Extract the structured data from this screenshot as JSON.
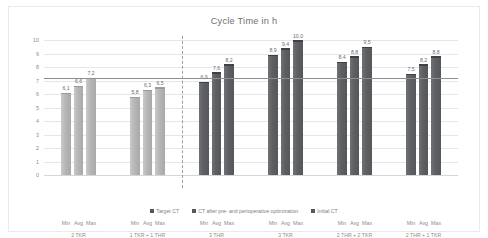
{
  "chart_data": {
    "type": "bar",
    "title": "Cycle Time in h",
    "xlabel": "",
    "ylabel": "",
    "ylim": [
      0,
      10
    ],
    "yticks": [
      "0",
      "1",
      "2",
      "3",
      "4",
      "5",
      "6",
      "7",
      "8",
      "9",
      "10"
    ],
    "grid": true,
    "legend_position": "bottom",
    "categories": [
      "Min",
      "Avg",
      "Max"
    ],
    "groups": [
      {
        "label": "2 TKR",
        "series": "ct_optimized",
        "values": [
          6.1,
          6.6,
          7.2
        ]
      },
      {
        "label": "1 TKR + 1 THR",
        "series": "ct_optimized",
        "values": [
          5.8,
          6.3,
          6.5
        ]
      },
      {
        "label": "3 THR",
        "series": "initial_ct",
        "values": [
          6.9,
          7.6,
          8.2
        ]
      },
      {
        "label": "3 TKR",
        "series": "initial_ct",
        "values": [
          8.9,
          9.4,
          10.0
        ]
      },
      {
        "label": "2 THR + 2 TKR",
        "series": "initial_ct",
        "values": [
          8.4,
          8.8,
          9.5
        ]
      },
      {
        "label": "2 THR + 1 TKR",
        "series": "initial_ct",
        "values": [
          7.5,
          8.2,
          8.8
        ]
      }
    ],
    "target_ct_line": 7.2,
    "annotations": {
      "separator_after_group_index": 1
    },
    "legend": [
      {
        "label": "Target CT",
        "color": "#55575b"
      },
      {
        "label": "CT after pre- and perioperative optimization",
        "color": "#55575b"
      },
      {
        "label": "Initial CT",
        "color": "#55575b"
      }
    ]
  },
  "colors": {
    "light_bar": "#b6b6b6",
    "dark_bar": "#5d5f63",
    "target_line": "#8b8e92",
    "gridline": "#e4e7ea",
    "text": "#8d8d8d",
    "title": "#6f6f6f",
    "background": "#ffffff"
  }
}
